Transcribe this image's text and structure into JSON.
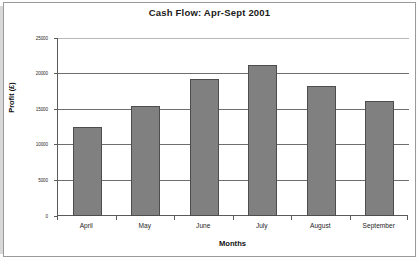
{
  "chart_data": {
    "type": "bar",
    "title": "Cash Flow: Apr-Sept 2001",
    "xlabel": "Months",
    "ylabel": "Profit (£)",
    "categories": [
      "April",
      "May",
      "June",
      "July",
      "August",
      "September"
    ],
    "values": [
      12500,
      15400,
      19300,
      21200,
      18200,
      16200
    ],
    "ylim": [
      0,
      25000
    ],
    "ytick_labels": [
      "0",
      "5000",
      "10000",
      "15000",
      "20000",
      "25000"
    ],
    "ytick_values": [
      0,
      5000,
      10000,
      15000,
      20000,
      25000
    ],
    "grid": true,
    "legend": false,
    "bar_color": "#808080",
    "bar_border_color": "#4d4d4d",
    "gridline_color": "#6e6e6e",
    "axis_color": "#5a5a5a",
    "plot_background": "#ffffff",
    "page_background": "#ffffff",
    "page_border_color": "#9a9a9a"
  }
}
